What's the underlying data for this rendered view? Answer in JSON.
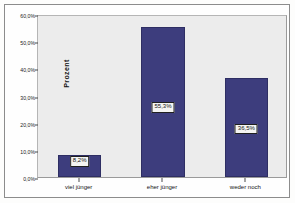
{
  "chart_data": {
    "type": "bar",
    "title": "",
    "subtitle": "",
    "xlabel": "",
    "ylabel": "Prozent",
    "categories": [
      "viel jünger",
      "eher jünger",
      "weder noch"
    ],
    "values": [
      8.2,
      55.3,
      36.5
    ],
    "value_labels": [
      "8,2%",
      "55,3%",
      "36,5%"
    ],
    "ylim": [
      0,
      60
    ],
    "ytick_values": [
      0,
      10,
      20,
      30,
      40,
      50,
      60
    ],
    "ytick_labels": [
      "0,0%",
      "10,0%",
      "20,0%",
      "30,0%",
      "40,0%",
      "50,0%",
      "60,0%"
    ],
    "grid": false,
    "legend": false,
    "legend_position": "none",
    "bar_color": "#3d3d7d",
    "bar_edge_color": "#2e2e63",
    "plot_background": "#ececec",
    "figure_background": "#fefefe",
    "label_box_background": "#f4f4f2",
    "label_box_border": "#202020",
    "axis_color": "#4a4a4a"
  }
}
